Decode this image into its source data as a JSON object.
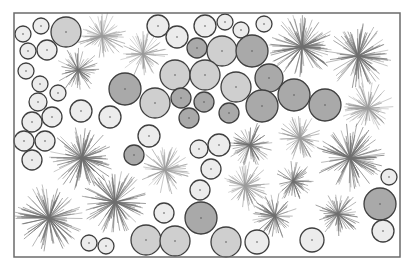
{
  "figure": {
    "frame": {
      "x": 14,
      "y": 13,
      "width": 386,
      "height": 244,
      "stroke": "#6b6b6b"
    },
    "shades": {
      "light": "#ececec",
      "mid": "#cfcfcf",
      "dark": "#a9a9a9",
      "stroke": "#3f3f3f",
      "burst_dark": "#6e6e6e",
      "burst_light": "#9a9a9a"
    },
    "circles": [
      {
        "cx": 23,
        "cy": 34,
        "r": 8,
        "shade": "light"
      },
      {
        "cx": 41,
        "cy": 26,
        "r": 8,
        "shade": "light"
      },
      {
        "cx": 28,
        "cy": 51,
        "r": 8,
        "shade": "light"
      },
      {
        "cx": 47,
        "cy": 50,
        "r": 10,
        "shade": "light"
      },
      {
        "cx": 26,
        "cy": 71,
        "r": 8,
        "shade": "light"
      },
      {
        "cx": 66,
        "cy": 32,
        "r": 15,
        "shade": "mid"
      },
      {
        "cx": 40,
        "cy": 84,
        "r": 8,
        "shade": "light"
      },
      {
        "cx": 58,
        "cy": 93,
        "r": 8,
        "shade": "light"
      },
      {
        "cx": 38,
        "cy": 102,
        "r": 9,
        "shade": "light"
      },
      {
        "cx": 32,
        "cy": 122,
        "r": 10,
        "shade": "light"
      },
      {
        "cx": 52,
        "cy": 117,
        "r": 10,
        "shade": "light"
      },
      {
        "cx": 24,
        "cy": 141,
        "r": 10,
        "shade": "light"
      },
      {
        "cx": 45,
        "cy": 141,
        "r": 10,
        "shade": "light"
      },
      {
        "cx": 32,
        "cy": 160,
        "r": 10,
        "shade": "light"
      },
      {
        "cx": 81,
        "cy": 111,
        "r": 11,
        "shade": "light"
      },
      {
        "cx": 110,
        "cy": 117,
        "r": 11,
        "shade": "light"
      },
      {
        "cx": 125,
        "cy": 89,
        "r": 16,
        "shade": "dark"
      },
      {
        "cx": 155,
        "cy": 103,
        "r": 15,
        "shade": "mid"
      },
      {
        "cx": 158,
        "cy": 26,
        "r": 11,
        "shade": "light"
      },
      {
        "cx": 177,
        "cy": 37,
        "r": 11,
        "shade": "light"
      },
      {
        "cx": 197,
        "cy": 48,
        "r": 10,
        "shade": "dark"
      },
      {
        "cx": 205,
        "cy": 26,
        "r": 11,
        "shade": "light"
      },
      {
        "cx": 225,
        "cy": 22,
        "r": 8,
        "shade": "light"
      },
      {
        "cx": 241,
        "cy": 30,
        "r": 8,
        "shade": "light"
      },
      {
        "cx": 264,
        "cy": 24,
        "r": 8,
        "shade": "light"
      },
      {
        "cx": 222,
        "cy": 51,
        "r": 15,
        "shade": "mid"
      },
      {
        "cx": 252,
        "cy": 51,
        "r": 16,
        "shade": "dark"
      },
      {
        "cx": 175,
        "cy": 75,
        "r": 15,
        "shade": "mid"
      },
      {
        "cx": 205,
        "cy": 75,
        "r": 15,
        "shade": "mid"
      },
      {
        "cx": 236,
        "cy": 87,
        "r": 15,
        "shade": "mid"
      },
      {
        "cx": 269,
        "cy": 78,
        "r": 14,
        "shade": "dark"
      },
      {
        "cx": 181,
        "cy": 98,
        "r": 10,
        "shade": "dark"
      },
      {
        "cx": 204,
        "cy": 102,
        "r": 10,
        "shade": "dark"
      },
      {
        "cx": 189,
        "cy": 118,
        "r": 10,
        "shade": "dark"
      },
      {
        "cx": 229,
        "cy": 113,
        "r": 10,
        "shade": "dark"
      },
      {
        "cx": 262,
        "cy": 106,
        "r": 16,
        "shade": "dark"
      },
      {
        "cx": 294,
        "cy": 95,
        "r": 16,
        "shade": "dark"
      },
      {
        "cx": 325,
        "cy": 105,
        "r": 16,
        "shade": "dark"
      },
      {
        "cx": 149,
        "cy": 136,
        "r": 11,
        "shade": "light"
      },
      {
        "cx": 134,
        "cy": 155,
        "r": 10,
        "shade": "dark"
      },
      {
        "cx": 199,
        "cy": 149,
        "r": 9,
        "shade": "light"
      },
      {
        "cx": 219,
        "cy": 145,
        "r": 11,
        "shade": "light"
      },
      {
        "cx": 211,
        "cy": 169,
        "r": 10,
        "shade": "light"
      },
      {
        "cx": 200,
        "cy": 190,
        "r": 10,
        "shade": "light"
      },
      {
        "cx": 164,
        "cy": 213,
        "r": 10,
        "shade": "light"
      },
      {
        "cx": 201,
        "cy": 218,
        "r": 16,
        "shade": "dark"
      },
      {
        "cx": 146,
        "cy": 240,
        "r": 15,
        "shade": "mid"
      },
      {
        "cx": 175,
        "cy": 241,
        "r": 15,
        "shade": "mid"
      },
      {
        "cx": 226,
        "cy": 242,
        "r": 15,
        "shade": "mid"
      },
      {
        "cx": 257,
        "cy": 242,
        "r": 12,
        "shade": "light"
      },
      {
        "cx": 89,
        "cy": 243,
        "r": 8,
        "shade": "light"
      },
      {
        "cx": 106,
        "cy": 246,
        "r": 8,
        "shade": "light"
      },
      {
        "cx": 312,
        "cy": 240,
        "r": 12,
        "shade": "light"
      },
      {
        "cx": 389,
        "cy": 177,
        "r": 8,
        "shade": "light"
      },
      {
        "cx": 380,
        "cy": 204,
        "r": 16,
        "shade": "dark"
      },
      {
        "cx": 383,
        "cy": 231,
        "r": 11,
        "shade": "light"
      }
    ],
    "bursts": [
      {
        "cx": 102,
        "cy": 36,
        "r": 24,
        "tone": "light",
        "rays": 70
      },
      {
        "cx": 78,
        "cy": 70,
        "r": 22,
        "tone": "dark",
        "rays": 60
      },
      {
        "cx": 143,
        "cy": 54,
        "r": 24,
        "tone": "light",
        "rays": 60
      },
      {
        "cx": 302,
        "cy": 47,
        "r": 32,
        "tone": "dark",
        "rays": 110
      },
      {
        "cx": 358,
        "cy": 56,
        "r": 32,
        "tone": "dark",
        "rays": 110
      },
      {
        "cx": 368,
        "cy": 108,
        "r": 25,
        "tone": "light",
        "rays": 80
      },
      {
        "cx": 82,
        "cy": 158,
        "r": 32,
        "tone": "dark",
        "rays": 110
      },
      {
        "cx": 165,
        "cy": 170,
        "r": 24,
        "tone": "light",
        "rays": 70
      },
      {
        "cx": 49,
        "cy": 218,
        "r": 33,
        "tone": "dark",
        "rays": 110
      },
      {
        "cx": 115,
        "cy": 202,
        "r": 32,
        "tone": "dark",
        "rays": 110
      },
      {
        "cx": 250,
        "cy": 145,
        "r": 22,
        "tone": "dark",
        "rays": 70
      },
      {
        "cx": 300,
        "cy": 138,
        "r": 22,
        "tone": "light",
        "rays": 70
      },
      {
        "cx": 350,
        "cy": 158,
        "r": 34,
        "tone": "dark",
        "rays": 110
      },
      {
        "cx": 245,
        "cy": 186,
        "r": 24,
        "tone": "light",
        "rays": 70
      },
      {
        "cx": 293,
        "cy": 181,
        "r": 20,
        "tone": "dark",
        "rays": 60
      },
      {
        "cx": 275,
        "cy": 216,
        "r": 22,
        "tone": "dark",
        "rays": 70
      },
      {
        "cx": 338,
        "cy": 214,
        "r": 23,
        "tone": "dark",
        "rays": 70
      }
    ]
  }
}
